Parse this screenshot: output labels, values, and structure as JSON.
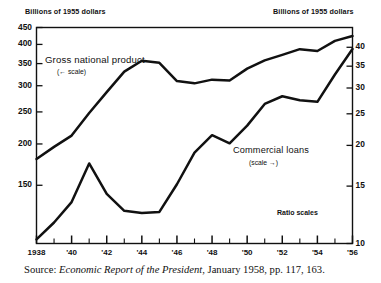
{
  "figure": {
    "left_axis_unit": "Billions of 1955 dollars",
    "right_axis_unit": "Billions of 1955 dollars",
    "ratio_note": "Ratio scales",
    "source_prefix": "Source:",
    "source_title": "Economic Report of the President",
    "source_rest": ", January 1958, pp. 117, 163."
  },
  "annotations": {
    "gnp_label": "Gross national product",
    "gnp_scale": "(← scale)",
    "loans_label": "Commercial loans",
    "loans_scale": "(scale →)"
  },
  "chart_data": {
    "type": "line",
    "title": "",
    "subtitle": "",
    "xlabel": "",
    "ylabel": "Billions of 1955 dollars",
    "y2label": "Billions of 1955 dollars",
    "grid": false,
    "legend_position": "inline-annotation",
    "scale": "log",
    "scale_note": "Ratio scales",
    "x": [
      1938,
      1939,
      1940,
      1941,
      1942,
      1943,
      1944,
      1945,
      1946,
      1947,
      1948,
      1949,
      1950,
      1951,
      1952,
      1953,
      1954,
      1955,
      1956
    ],
    "xticks_major": [
      "1938",
      "'40",
      "'42",
      "'44",
      "'46",
      "'48",
      "'50",
      "'52",
      "'54",
      "'56"
    ],
    "xtick_major_years": [
      1938,
      1940,
      1942,
      1944,
      1946,
      1948,
      1950,
      1952,
      1954,
      1956
    ],
    "xlim": [
      1938,
      1956
    ],
    "yticks_left": [
      450,
      400,
      350,
      300,
      250,
      200,
      150
    ],
    "ylim_left": [
      100,
      460
    ],
    "yticks_right": [
      40,
      35,
      30,
      25,
      20,
      15,
      10
    ],
    "ylim_right": [
      10,
      46
    ],
    "series": [
      {
        "name": "Gross national product",
        "axis": "left",
        "scale_arrow": "left",
        "unit": "Billions of 1955 dollars",
        "values": [
          180,
          196,
          212,
          248,
          287,
          331,
          357,
          352,
          310,
          305,
          313,
          311,
          338,
          358,
          372,
          387,
          382,
          410,
          424
        ]
      },
      {
        "name": "Commercial loans",
        "axis": "right",
        "scale_arrow": "right",
        "unit": "Billions of 1955 dollars",
        "values": [
          10.3,
          11.6,
          13.4,
          17.6,
          14.2,
          12.6,
          12.4,
          12.5,
          15.2,
          19.0,
          21.5,
          20.3,
          23.0,
          26.8,
          28.3,
          27.5,
          27.2,
          33.0,
          39.5
        ]
      }
    ]
  }
}
